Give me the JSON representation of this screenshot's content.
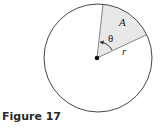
{
  "figure": {
    "caption": "Figure 17",
    "labels": {
      "area": "A",
      "angle": "θ",
      "radius": "r"
    },
    "colors": {
      "sector_fill": "#e8e8e8",
      "stroke": "#333333"
    }
  }
}
